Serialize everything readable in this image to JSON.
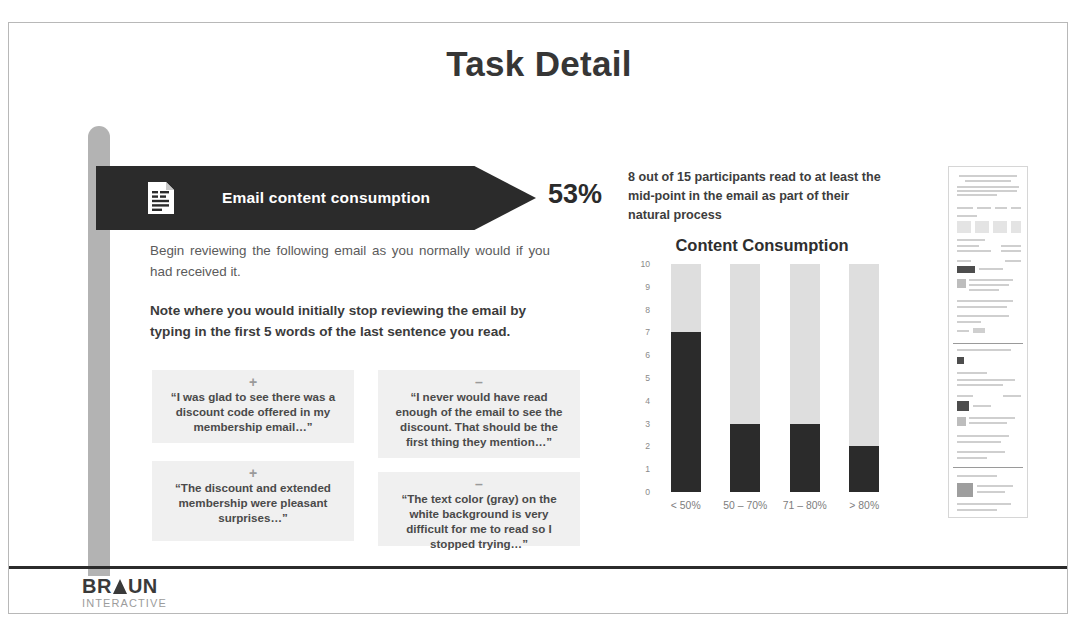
{
  "slide": {
    "title": "Task Detail",
    "percent_value": "53%"
  },
  "banner": {
    "label": "Email content consumption",
    "icon": "document-icon"
  },
  "body": {
    "paragraph": "Begin reviewing the following email as you normally would if you had received it.",
    "note": "Note where you would initially stop reviewing the email by typing in the first 5 words of the last sentence you read."
  },
  "quotes": [
    {
      "sign": "+",
      "text": "“I was glad to see there was a discount code offered in my membership email…”"
    },
    {
      "sign": "–",
      "text": "“I never would have read enough of the email to see the discount. That should be the first thing they mention…”"
    },
    {
      "sign": "+",
      "text": "“The discount and extended membership were pleasant surprises…”"
    },
    {
      "sign": "–",
      "text": "“The text color (gray) on the white background is very difficult for me to read so I stopped trying…”"
    }
  ],
  "stat": {
    "blurb": "8 out of 15 participants read to at least the mid-point in the email as part of their natural process"
  },
  "chart_data": {
    "type": "bar",
    "title": "Content Consumption",
    "xlabel": "",
    "ylabel": "",
    "categories": [
      "< 50%",
      "50 – 70%",
      "71 – 80%",
      "> 80%"
    ],
    "values": [
      7,
      3,
      3,
      2
    ],
    "ylim": [
      0,
      10
    ],
    "yticks": [
      10,
      9,
      8,
      7,
      6,
      5,
      4,
      3,
      2,
      1,
      0
    ],
    "grid": false,
    "legend": "none",
    "bar_color": "#2b2b2b",
    "track_color": "#dedede",
    "note": "Stacked appearance: dark fill = participants, light gray = remainder up to 10"
  },
  "thumbnail": {
    "name": "email-screenshot-thumbnail"
  },
  "footer": {
    "logo_part1": "BR",
    "logo_part2": "UN",
    "logo_sub": "INTERACTIVE",
    "faint_text": ""
  }
}
